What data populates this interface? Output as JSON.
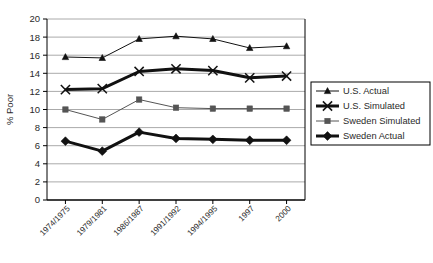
{
  "chart_data": {
    "type": "line",
    "title": "",
    "xlabel": "",
    "ylabel": "% Poor",
    "ylim": [
      0,
      20
    ],
    "ytick_step": 2,
    "grid": true,
    "legend_position": "right",
    "categories": [
      "1974/1975",
      "1979/1981",
      "1986/1987",
      "1991/1992",
      "1994/1995",
      "1997",
      "2000"
    ],
    "yticks": [
      "0",
      "2",
      "4",
      "6",
      "8",
      "10",
      "12",
      "14",
      "16",
      "18",
      "20"
    ],
    "series": [
      {
        "name": "U.S. Actual",
        "marker": "triangle",
        "color": "#111111",
        "line_width": 1,
        "values": [
          15.8,
          15.7,
          17.8,
          18.1,
          17.8,
          16.8,
          17.0
        ]
      },
      {
        "name": "U.S. Simulated",
        "marker": "x",
        "color": "#111111",
        "line_width": 3,
        "values": [
          12.2,
          12.3,
          14.2,
          14.5,
          14.3,
          13.5,
          13.7
        ]
      },
      {
        "name": "Sweden Simulated",
        "marker": "square",
        "color": "#555555",
        "line_width": 1,
        "values": [
          10.0,
          8.9,
          11.1,
          10.2,
          10.1,
          10.1,
          10.1
        ]
      },
      {
        "name": "Sweden Actual",
        "marker": "diamond",
        "color": "#111111",
        "line_width": 3,
        "values": [
          6.5,
          5.4,
          7.5,
          6.8,
          6.7,
          6.6,
          6.6
        ]
      }
    ]
  },
  "legend": {
    "items": [
      {
        "label": "U.S. Actual"
      },
      {
        "label": "U.S. Simulated"
      },
      {
        "label": "Sweden Simulated"
      },
      {
        "label": "Sweden Actual"
      }
    ]
  }
}
